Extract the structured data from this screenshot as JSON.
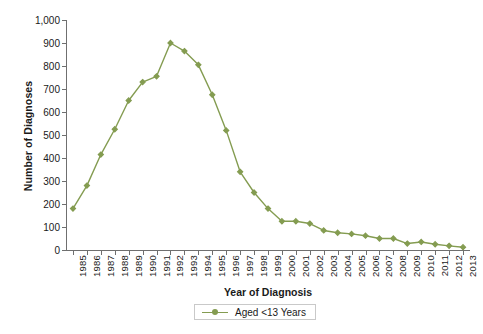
{
  "chart_data": {
    "type": "line",
    "title": "",
    "xlabel": "Year of Diagnosis",
    "ylabel": "Number of Diagnoses",
    "ylim": [
      0,
      1000
    ],
    "ytick_labels": [
      "0",
      "100",
      "200",
      "300",
      "400",
      "500",
      "600",
      "700",
      "800",
      "900",
      "1,000"
    ],
    "ytick_values": [
      0,
      100,
      200,
      300,
      400,
      500,
      600,
      700,
      800,
      900,
      1000
    ],
    "grid": false,
    "legend_position": "bottom-center",
    "categories": [
      "1985",
      "1986",
      "1987",
      "1988",
      "1989",
      "1990",
      "1991",
      "1992",
      "1993",
      "1994",
      "1995",
      "1996",
      "1997",
      "1998",
      "1999",
      "2000",
      "2001",
      "2002",
      "2003",
      "2004",
      "2005",
      "2006",
      "2007",
      "2008",
      "2009",
      "2010",
      "2011",
      "2012",
      "2013"
    ],
    "series": [
      {
        "name": "Aged <13 Years",
        "color": "#849c51",
        "marker": "diamond",
        "values": [
          180,
          280,
          415,
          525,
          650,
          730,
          755,
          900,
          865,
          805,
          675,
          520,
          340,
          250,
          180,
          125,
          125,
          115,
          85,
          75,
          70,
          62,
          50,
          50,
          28,
          35,
          25,
          18,
          12
        ]
      }
    ]
  },
  "legend": {
    "entries": [
      {
        "label": "Aged <13 Years"
      }
    ]
  },
  "colors": {
    "series_green": "#849c51",
    "axis_gray": "#6f6f6f",
    "text_dark": "#1a1a1a",
    "legend_border": "#c9c9c9"
  }
}
